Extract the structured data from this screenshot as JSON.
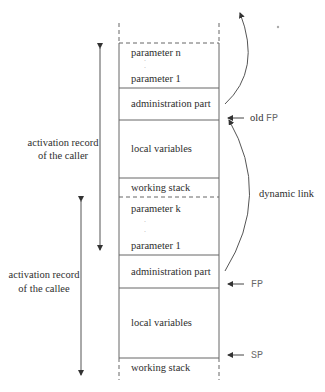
{
  "diagram": {
    "stack_cells": {
      "caller_params": {
        "first": "parameter n",
        "last": "parameter 1"
      },
      "caller_admin": "administration part",
      "caller_locals": "local variables",
      "caller_working": "working stack",
      "callee_params": {
        "first": "parameter k",
        "last": "parameter 1"
      },
      "callee_admin": "administration part",
      "callee_locals": "local variables",
      "callee_working": "working stack"
    },
    "left_labels": {
      "caller": {
        "line1": "activation record",
        "line2": "of the caller"
      },
      "callee": {
        "line1": "activation record",
        "line2": "of the callee"
      }
    },
    "right_labels": {
      "old_fp_prefix": "old",
      "old_fp": "FP",
      "dynamic_link": "dynamic link",
      "fp": "FP",
      "sp": "SP"
    },
    "ellipsis_dot": "·",
    "colors": {
      "line": "#555555",
      "pointer_text": "#6a6a6a"
    }
  }
}
